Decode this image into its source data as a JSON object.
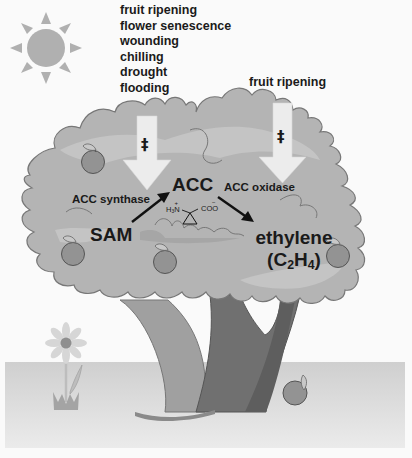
{
  "stimuli_left": {
    "items": [
      "fruit ripening",
      "flower senescence",
      "wounding",
      "chilling",
      "drought",
      "flooding"
    ]
  },
  "stimuli_right": {
    "items": [
      "fruit ripening"
    ]
  },
  "regulation_symbol": "‡",
  "pathway": {
    "substrate": "SAM",
    "enzyme1": "ACC synthase",
    "intermediate": "ACC",
    "enzyme2": "ACC oxidase",
    "product": "ethylene",
    "product_formula_open": "(C",
    "product_formula_sub1": "2",
    "product_formula_mid": "H",
    "product_formula_sub2": "4",
    "product_formula_close": ")"
  },
  "acc_structure": {
    "amine": "H",
    "amine_sub": "3",
    "amine_n": "N",
    "amine_charge": "+",
    "carboxylate": "COO",
    "carboxylate_charge": "−"
  },
  "colors": {
    "background": "#fafafa",
    "foliage": "#b4b4b4",
    "foliage_light": "#c2c2c2",
    "foliage_outline": "#777777",
    "trunk_dark": "#6e6e6e",
    "trunk_light": "#9a9a9a",
    "ground_top": "#d2d2d2",
    "ground_bottom": "#e8e8e8",
    "sun": "#b0b0b0",
    "apple": "#939393",
    "arrow_fill": "#ececec",
    "text": "#1a1a1a"
  }
}
